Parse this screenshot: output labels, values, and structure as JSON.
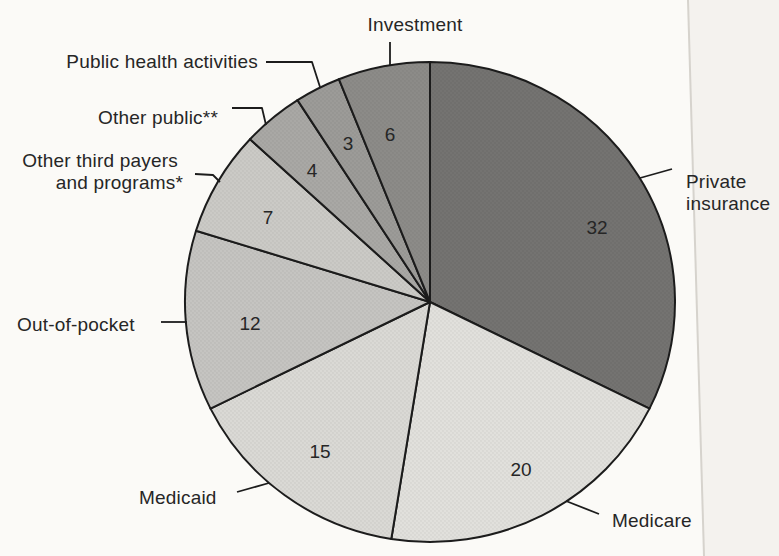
{
  "page": {
    "background_color": "#fbfaf7",
    "scan_edge": {
      "line_color": "#d6d3cd",
      "strip_color": "#f4f2ee"
    }
  },
  "chart_data": {
    "type": "pie",
    "direction": "clockwise",
    "start_angle": "12-o-clock",
    "outline_color": "#1c1c1c",
    "text_color": "#262626",
    "slices": [
      {
        "label": "Private insurance",
        "value": 32,
        "color": "#747371"
      },
      {
        "label": "Medicare",
        "value": 20,
        "color": "#e1e0dc"
      },
      {
        "label": "Medicaid",
        "value": 15,
        "color": "#dad9d5"
      },
      {
        "label": "Out-of-pocket",
        "value": 12,
        "color": "#c5c4c1"
      },
      {
        "label": "Other third payers and programs*",
        "value": 7,
        "color": "#cbcac6"
      },
      {
        "label": "Other public**",
        "value": 4,
        "color": "#a9a8a5"
      },
      {
        "label": "Public health activities",
        "value": 3,
        "color": "#9c9b98"
      },
      {
        "label": "Investment",
        "value": 6,
        "color": "#8c8b88"
      }
    ]
  },
  "annotations": {
    "other_third_line1": "Other third payers",
    "other_third_line2": "and programs*",
    "private_line1": "Private",
    "private_line2": "insurance"
  }
}
